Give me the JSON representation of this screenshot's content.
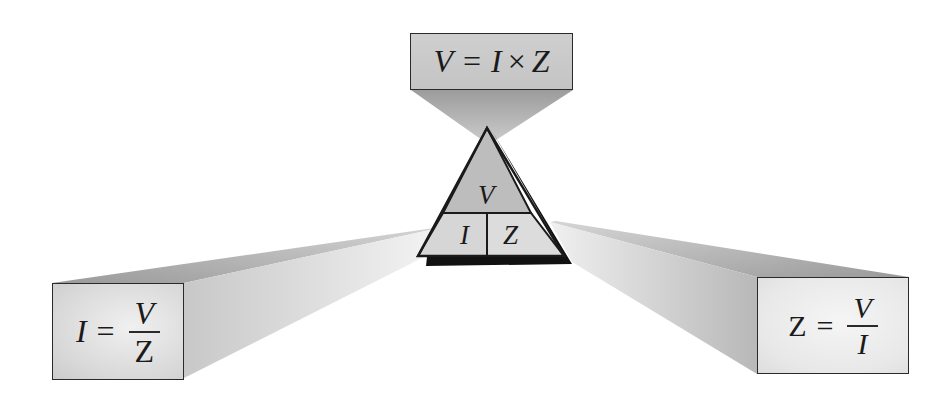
{
  "diagram": {
    "triangle": {
      "top_label": "V",
      "bottom_left_label": "I",
      "bottom_right_label": "Z"
    },
    "formulas": {
      "top": {
        "lhs": "V",
        "equals": "=",
        "rhs_a": "I",
        "op": "×",
        "rhs_b": "Z"
      },
      "left": {
        "lhs": "I",
        "equals": "=",
        "numerator": "V",
        "denominator": "Z"
      },
      "right": {
        "lhs": "Z",
        "equals": "=",
        "numerator": "V",
        "denominator": "I"
      }
    },
    "colors": {
      "triangle_top": "#bdbdbd",
      "triangle_bottom": "#d9d9d9",
      "outline": "#1a1a1a",
      "beam_dark": "#a8a8a8",
      "beam_light": "#d6d6d6",
      "background": "#ffffff"
    }
  }
}
